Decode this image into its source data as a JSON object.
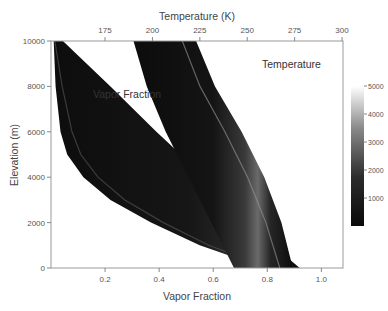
{
  "chart_data": {
    "type": "heatmap",
    "bottom_axis": {
      "label": "Vapor Fraction",
      "range": [
        0.0,
        1.08
      ],
      "ticks": [
        0.2,
        0.4,
        0.6,
        0.8,
        1.0
      ],
      "tick_labels": [
        "0.2",
        "0.4",
        "0.6",
        "0.8",
        "1.0"
      ]
    },
    "top_axis": {
      "label": "Temperature (K)",
      "range": [
        146.5,
        300.5
      ],
      "ticks": [
        175,
        200,
        225,
        250,
        275,
        300
      ],
      "tick_labels": [
        "175",
        "200",
        "225",
        "250",
        "275",
        "300"
      ]
    },
    "y_axis": {
      "label": "Elevation (m)",
      "range": [
        0,
        10000
      ],
      "ticks": [
        0,
        2000,
        4000,
        6000,
        8000,
        10000
      ],
      "tick_labels": [
        "0",
        "2000",
        "4000",
        "6000",
        "8000",
        "10000"
      ]
    },
    "colorbar": {
      "range": [
        0,
        5000
      ],
      "ticks": [
        1000,
        2000,
        3000,
        4000,
        5000
      ],
      "tick_labels": [
        "1000",
        "2000",
        "3000",
        "4000",
        "5000"
      ],
      "colormap": "gray"
    },
    "series": [
      {
        "name": "Vapor Fraction",
        "axis": "bottom",
        "elevation": [
          10000,
          8000,
          6000,
          5000,
          4000,
          3000,
          2000,
          1000,
          500,
          0
        ],
        "lower": [
          0.01,
          0.017,
          0.035,
          0.06,
          0.12,
          0.22,
          0.37,
          0.55,
          0.67,
          0.83
        ],
        "upper": [
          0.044,
          0.22,
          0.39,
          0.48,
          0.57,
          0.66,
          0.75,
          0.83,
          0.87,
          0.92
        ],
        "peak_value": 5000
      },
      {
        "name": "Temperature",
        "axis": "top",
        "elevation": [
          10000,
          8000,
          6000,
          4000,
          2000,
          0
        ],
        "lower": [
          190,
          197,
          207,
          219,
          231,
          243
        ],
        "upper": [
          223,
          233,
          247,
          259,
          268,
          274
        ],
        "peak_value": 5000
      }
    ],
    "annotations": [
      {
        "text": "Vapor Fraction",
        "position": "upper-left of center"
      },
      {
        "text": "Temperature",
        "position": "top-right"
      }
    ]
  }
}
